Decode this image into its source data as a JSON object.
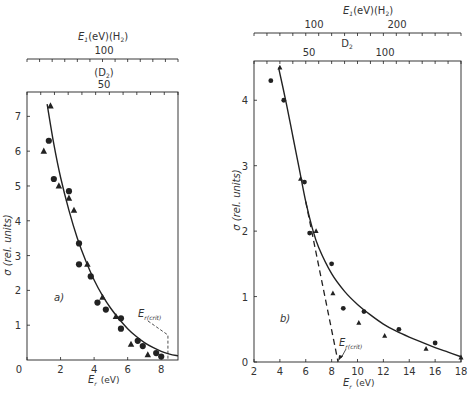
{
  "chart_data": [
    {
      "panel": "a)",
      "type": "scatter",
      "title": "",
      "xlabel": "E_r (eV)",
      "ylabel": "σ (rel. units)",
      "xlim": [
        0,
        9
      ],
      "ylim": [
        0,
        7.7
      ],
      "xticks": [
        0,
        2,
        4,
        6,
        8
      ],
      "yticks": [
        1,
        2,
        3,
        4,
        5,
        6,
        7
      ],
      "top_axis_1": {
        "label": "E_1 (eV)(H_2)",
        "ticks": [
          "100"
        ]
      },
      "top_axis_2": {
        "label": "(D_2)",
        "ticks": [
          "50"
        ]
      },
      "annotation": "E_r(crit)",
      "annotation_x": 8.4,
      "grid": false,
      "series": [
        {
          "name": "circles",
          "marker": "circle",
          "x": [
            1.3,
            1.6,
            2.5,
            3.1,
            3.1,
            3.8,
            4.2,
            4.7,
            5.6,
            5.6,
            6.6,
            6.9,
            7.7,
            8.0
          ],
          "y": [
            6.3,
            5.2,
            4.85,
            3.35,
            2.75,
            2.4,
            1.65,
            1.45,
            1.2,
            0.9,
            0.55,
            0.4,
            0.2,
            0.1
          ]
        },
        {
          "name": "triangles",
          "marker": "triangle",
          "x": [
            1.0,
            1.4,
            1.9,
            2.5,
            2.8,
            3.6,
            4.5,
            5.3,
            6.2,
            7.2
          ],
          "y": [
            6.0,
            7.3,
            5.0,
            4.65,
            4.3,
            2.75,
            1.8,
            1.25,
            0.45,
            0.15
          ]
        },
        {
          "name": "fit",
          "marker": "line",
          "x": [
            1.2,
            1.6,
            2.0,
            2.5,
            3.0,
            3.5,
            4.0,
            4.5,
            5.0,
            5.5,
            6.0,
            6.5,
            7.0,
            7.5,
            8.0,
            8.5,
            9.0
          ],
          "y": [
            7.35,
            6.2,
            5.25,
            4.3,
            3.5,
            2.85,
            2.3,
            1.85,
            1.48,
            1.17,
            0.9,
            0.68,
            0.5,
            0.36,
            0.25,
            0.17,
            0.12
          ]
        }
      ]
    },
    {
      "panel": "b)",
      "type": "scatter",
      "title": "",
      "xlabel": "E_r (eV)",
      "ylabel": "σ (rel. units)",
      "xlim": [
        2,
        18
      ],
      "ylim": [
        0,
        4.6
      ],
      "xticks": [
        2,
        4,
        6,
        8,
        10,
        12,
        14,
        16,
        18
      ],
      "yticks": [
        0,
        1,
        2,
        3,
        4
      ],
      "top_axis_1": {
        "label": "E_1(eV)(H_2)",
        "ticks": [
          "100",
          "200"
        ]
      },
      "top_axis_2": {
        "label": "D_2",
        "ticks": [
          "50",
          "100"
        ]
      },
      "annotation": "E_r(crit)",
      "annotation_x": 8.5,
      "grid": false,
      "series": [
        {
          "name": "circles",
          "marker": "circle",
          "x": [
            3.3,
            4.3,
            5.9,
            6.3,
            8.0,
            8.9,
            10.5,
            13.2,
            16.0
          ],
          "y": [
            4.3,
            4.0,
            2.75,
            1.97,
            1.5,
            0.82,
            0.77,
            0.5,
            0.29
          ]
        },
        {
          "name": "triangles",
          "marker": "triangle",
          "x": [
            4.0,
            5.6,
            6.8,
            8.1,
            10.1,
            12.1,
            15.3,
            18.0
          ],
          "y": [
            4.5,
            2.8,
            2.0,
            1.05,
            0.6,
            0.4,
            0.2,
            0.07
          ]
        },
        {
          "name": "fit",
          "marker": "line",
          "x": [
            3.9,
            4.5,
            5.0,
            5.5,
            6.0,
            6.5,
            7.0,
            8.0,
            9.0,
            10.0,
            11.0,
            12.0,
            13.0,
            14.0,
            15.0,
            16.0,
            17.0,
            18.0
          ],
          "y": [
            4.5,
            3.95,
            3.45,
            2.95,
            2.45,
            2.05,
            1.75,
            1.35,
            1.08,
            0.88,
            0.72,
            0.58,
            0.47,
            0.38,
            0.3,
            0.22,
            0.15,
            0.08
          ]
        },
        {
          "name": "extrapolation",
          "marker": "dashed-line",
          "x": [
            6.0,
            8.5
          ],
          "y": [
            2.45,
            0.0
          ]
        }
      ]
    }
  ],
  "labels": {
    "a": {
      "panel": "a)",
      "top1_title_E": "E",
      "top1_title_sub": "1",
      "top1_title_rest": "(eV)(H",
      "top1_title_sub2": "2",
      "top1_title_close": ")",
      "top1_tick": "100",
      "top2_title": "(D",
      "top2_sub": "2",
      "top2_close": ")",
      "top2_tick": "50",
      "ylabel": "σ (rel. units)",
      "xlabel_E": "E",
      "xlabel_sub": "r",
      "xlabel_unit": "(eV)",
      "crit_E": "E",
      "crit_sub": "r(crit)",
      "xticks": [
        "0",
        "2",
        "4",
        "6",
        "8"
      ],
      "yticks": [
        "1",
        "2",
        "3",
        "4",
        "5",
        "6",
        "7"
      ]
    },
    "b": {
      "panel": "b)",
      "top1_title_E": "E",
      "top1_title_sub": "1",
      "top1_title_rest": "(eV)(H",
      "top1_title_sub2": "2",
      "top1_title_close": ")",
      "top1_ticks": [
        "100",
        "200"
      ],
      "top2_title": "D",
      "top2_sub": "2",
      "top2_ticks": [
        "50",
        "100"
      ],
      "ylabel": "σ (rel. units)",
      "xlabel_E": "E",
      "xlabel_sub": "r",
      "xlabel_unit": "(eV)",
      "crit_E": "E",
      "crit_sub": "r(crit)",
      "xticks": [
        "2",
        "4",
        "6",
        "8",
        "10",
        "12",
        "14",
        "16",
        "18"
      ],
      "yticks": [
        "0",
        "1",
        "2",
        "3",
        "4"
      ]
    }
  }
}
